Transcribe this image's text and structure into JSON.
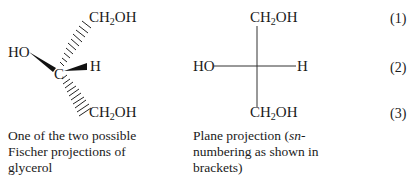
{
  "fischer": {
    "top": {
      "pre": "CH",
      "sub": "2",
      "post": "OH"
    },
    "left": "HO",
    "center": "C",
    "right": "H",
    "bottom": {
      "pre": "CH",
      "sub": "2",
      "post": "OH"
    },
    "caption": "One of the two possible Fischer projections of glycerol"
  },
  "plane": {
    "top": {
      "pre": "CH",
      "sub": "2",
      "post": "OH"
    },
    "left": "HO",
    "right": "H",
    "bottom": {
      "pre": "CH",
      "sub": "2",
      "post": "OH"
    },
    "caption_pre": "Plane projection (",
    "caption_italic": "sn",
    "caption_post": "-numbering as shown in brackets)"
  },
  "numbering": [
    "(1)",
    "(2)",
    "(3)"
  ]
}
